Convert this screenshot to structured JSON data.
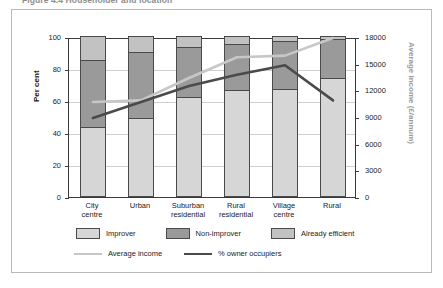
{
  "caption": {
    "text": "Figure 4.4   Householder and location"
  },
  "chart_data": {
    "type": "bar",
    "title": "",
    "subtitle": "",
    "categories": [
      "City centre",
      "Urban",
      "Suburban residential",
      "Rural residential",
      "Village centre",
      "Rural"
    ],
    "category_lines": [
      [
        "City",
        "centre"
      ],
      [
        "Urban",
        ""
      ],
      [
        "Suburban",
        "residential"
      ],
      [
        "Rural",
        "residential"
      ],
      [
        "Village",
        "centre"
      ],
      [
        "Rural",
        ""
      ]
    ],
    "xlabel": "",
    "ylabel": "Per cent",
    "ylim": [
      0,
      100
    ],
    "yticks": [
      0,
      20,
      40,
      60,
      80,
      100
    ],
    "y2label": "Average income (£/annum)",
    "y2lim": [
      0,
      18000
    ],
    "y2ticks": [
      0,
      3000,
      6000,
      9000,
      12000,
      15000,
      18000
    ],
    "grid": true,
    "legend_position": "bottom",
    "stacked": true,
    "series": [
      {
        "name": "Improver",
        "type": "bar",
        "axis": "left",
        "color": "#d6d6d6",
        "values": [
          43,
          49,
          62,
          66,
          67,
          74
        ]
      },
      {
        "name": "Non-improver",
        "type": "bar",
        "axis": "left",
        "color": "#9a9a9a",
        "values": [
          42,
          41,
          31,
          29,
          30,
          24
        ]
      },
      {
        "name": "Already efficient",
        "type": "bar",
        "axis": "left",
        "color": "#c2c2c2",
        "values": [
          15,
          10,
          7,
          5,
          3,
          2
        ]
      },
      {
        "name": "Average income",
        "type": "line",
        "axis": "right",
        "color": "#c7c7c7",
        "values_pct": [
          60,
          61,
          75,
          88,
          89,
          100
        ],
        "values": [
          10800,
          10980,
          13500,
          15840,
          16020,
          18000
        ]
      },
      {
        "name": "% owner occupiers",
        "type": "line",
        "axis": "left",
        "color": "#4a4a4a",
        "values": [
          50,
          60,
          70,
          77,
          83,
          61
        ]
      }
    ]
  },
  "legend": {
    "row1": [
      {
        "label": "Improver",
        "swatch": "improver-swatch",
        "color": "#d6d6d6"
      },
      {
        "label": "Non-improver",
        "swatch": "non-improver-swatch",
        "color": "#9a9a9a"
      },
      {
        "label": "Already efficient",
        "swatch": "already-efficient-swatch",
        "color": "#c2c2c2"
      }
    ],
    "row2": [
      {
        "label": "Average income",
        "swatch": "average-income-line-swatch",
        "color": "#c7c7c7"
      },
      {
        "label": "% owner occupiers",
        "swatch": "owner-occupiers-line-swatch",
        "color": "#4a4a4a"
      }
    ]
  }
}
